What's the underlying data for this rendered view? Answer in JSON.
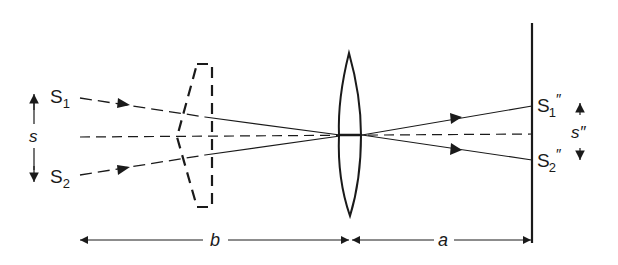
{
  "diagram": {
    "type": "optics-ray-diagram",
    "colors": {
      "ink": "#1a1a1a",
      "background": "#ffffff"
    },
    "labels": {
      "s1": "S",
      "s1_sub": "1",
      "s2": "S",
      "s2_sub": "2",
      "s_sep": "s",
      "s1_image": "S",
      "s1_image_sub": "1",
      "s1_image_prime": "″",
      "s2_image": "S",
      "s2_image_sub": "2",
      "s2_image_prime": "″",
      "s_image_sep": "s″",
      "dist_b": "b",
      "dist_a": "a"
    },
    "elements": [
      "source-S1",
      "source-S2",
      "biprism-dashed",
      "converging-lens",
      "screen",
      "optical-axis-dashed",
      "separation-arrow-s",
      "separation-arrow-s-double-prime",
      "dimension-b",
      "dimension-a"
    ]
  }
}
